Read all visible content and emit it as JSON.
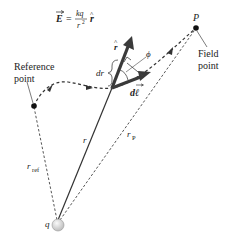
{
  "diagram": {
    "title_equation": {
      "lhs": "E",
      "equals": "=",
      "numerator": "kq",
      "denominator": "r",
      "denominator_exp": "2",
      "unit_vector": "r"
    },
    "labels": {
      "reference_point_line1": "Reference",
      "reference_point_line2": "point",
      "field_point_line1": "Field",
      "field_point_line2": "point",
      "P": "P",
      "q": "q",
      "r": "r",
      "r_ref_main": "r",
      "r_ref_sub": "ref",
      "r_P_main": "r",
      "r_P_sub": "P",
      "r_hat": "r",
      "phi": "ϕ",
      "dr": "dr",
      "dl": "dℓ"
    },
    "colors": {
      "stroke": "#333333",
      "arrow": "#3a3a3a",
      "charge_fill": "#e4e4e4",
      "text": "#222222"
    }
  }
}
